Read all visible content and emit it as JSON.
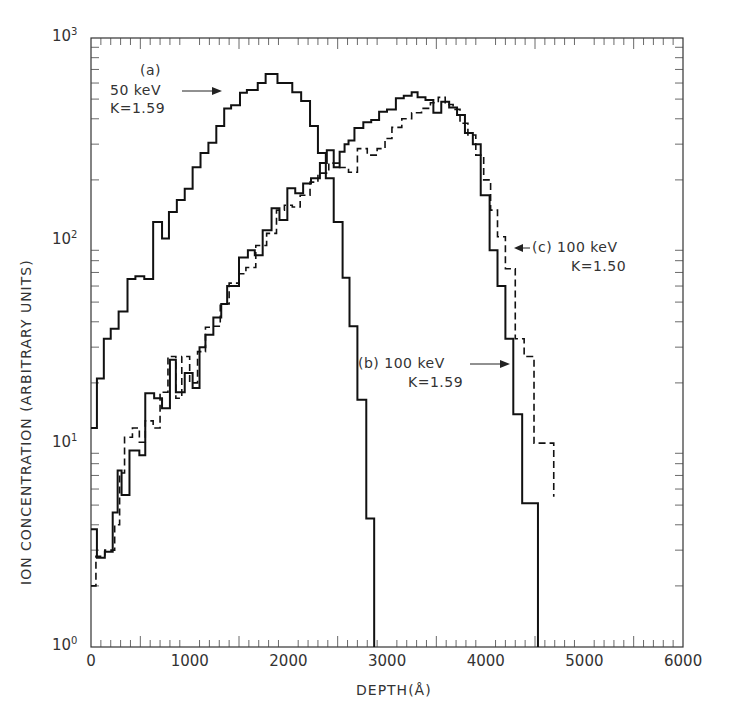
{
  "chart_data": {
    "type": "line",
    "title": "",
    "xlabel": "DEPTH(Å)",
    "ylabel": "ION CONCENTRATION (ARBITRARY UNITS)",
    "xlim": [
      0,
      6000
    ],
    "ylim": [
      1,
      1000
    ],
    "yscale": "log",
    "grid": false,
    "x_ticks": [
      0,
      1000,
      2000,
      3000,
      4000,
      5000,
      6000
    ],
    "x_tick_labels": [
      "0",
      "1000",
      "2000",
      "3000",
      "4000",
      "5000",
      "6000"
    ],
    "y_ticks": [
      1,
      10,
      100,
      1000
    ],
    "y_tick_labels": [
      {
        "base": "10",
        "exp": "0"
      },
      {
        "base": "10",
        "exp": "1"
      },
      {
        "base": "10",
        "exp": "2"
      },
      {
        "base": "10",
        "exp": "3"
      }
    ],
    "step_style": "histogram",
    "series": [
      {
        "name": "(a) 50 keV K=1.59",
        "style": "solid",
        "edges": [
          0,
          60,
          130,
          200,
          280,
          370,
          450,
          540,
          630,
          720,
          790,
          870,
          950,
          1030,
          1110,
          1190,
          1270,
          1350,
          1420,
          1510,
          1580,
          1690,
          1770,
          1890,
          2040,
          2130,
          2220,
          2300,
          2380,
          2460,
          2550,
          2620,
          2700,
          2790,
          2870
        ],
        "values": [
          12,
          21,
          33,
          37,
          45,
          65,
          67,
          65,
          124,
          103,
          139,
          159,
          181,
          231,
          271,
          305,
          369,
          449,
          466,
          538,
          555,
          600,
          665,
          600,
          540,
          490,
          369,
          271,
          204,
          124,
          66,
          38,
          16.5,
          4.3
        ]
      },
      {
        "name": "(b) 100 keV K=1.59",
        "style": "solid",
        "edges": [
          0,
          60,
          140,
          220,
          270,
          310,
          390,
          490,
          550,
          640,
          720,
          800,
          860,
          950,
          1030,
          1100,
          1160,
          1240,
          1320,
          1380,
          1440,
          1500,
          1590,
          1660,
          1740,
          1830,
          1910,
          1990,
          2070,
          2150,
          2230,
          2320,
          2390,
          2460,
          2520,
          2570,
          2610,
          2670,
          2760,
          2840,
          2920,
          3000,
          3090,
          3170,
          3250,
          3310,
          3390,
          3470,
          3550,
          3630,
          3710,
          3790,
          3870,
          3950,
          4040,
          4120,
          4200,
          4280,
          4370,
          4530
        ],
        "values": [
          3.8,
          2.75,
          2.95,
          4.6,
          7.4,
          5.6,
          9.3,
          8.8,
          17.8,
          16.8,
          15,
          26,
          18,
          22.4,
          18.9,
          30,
          34.5,
          42,
          49,
          60,
          60,
          83,
          90,
          85,
          113,
          145,
          127,
          182,
          172,
          192,
          204,
          242,
          280,
          231,
          275,
          300,
          313,
          360,
          385,
          395,
          433,
          445,
          505,
          520,
          540,
          510,
          495,
          428,
          485,
          455,
          418,
          340,
          300,
          168,
          90,
          60,
          33,
          14,
          5.1
        ]
      },
      {
        "name": "(c) 100 keV K=1.50",
        "style": "dashed",
        "edges": [
          0,
          50,
          140,
          240,
          290,
          340,
          420,
          490,
          550,
          630,
          700,
          780,
          860,
          920,
          1000,
          1080,
          1160,
          1230,
          1310,
          1400,
          1500,
          1570,
          1670,
          1780,
          1880,
          1960,
          2040,
          2120,
          2220,
          2300,
          2410,
          2510,
          2610,
          2700,
          2800,
          2900,
          2980,
          3050,
          3150,
          3250,
          3350,
          3440,
          3520,
          3590,
          3670,
          3740,
          3820,
          3900,
          3980,
          4050,
          4120,
          4200,
          4300,
          4390,
          4490,
          4690
        ],
        "values": [
          2,
          2.8,
          3,
          4,
          7.2,
          10.8,
          12,
          10.2,
          13,
          12,
          18,
          27,
          16.8,
          27,
          20,
          28.5,
          37.6,
          38,
          49,
          62,
          69,
          74,
          95,
          109,
          142,
          150,
          147,
          168,
          195,
          216,
          242,
          230,
          218,
          285,
          265,
          285,
          320,
          363,
          400,
          428,
          450,
          480,
          510,
          470,
          445,
          380,
          333,
          265,
          200,
          142,
          105,
          73,
          33,
          27,
          10.1,
          5.5
        ]
      }
    ],
    "annotations": [
      {
        "lines": [
          "(a)",
          "50 keV",
          "K=1.59"
        ],
        "points_to_series": "(a) 50 keV K=1.59"
      },
      {
        "lines": [
          "(b) 100 keV",
          "K=1.59"
        ],
        "points_to_series": "(b) 100 keV K=1.59"
      },
      {
        "lines": [
          "(c) 100 keV",
          "K=1.50"
        ],
        "points_to_series": "(c) 100 keV K=1.50"
      }
    ]
  },
  "labels": {
    "xlabel": "DEPTH(Å)",
    "ylabel": "ION CONCENTRATION (ARBITRARY UNITS)",
    "a_line1": "(a)",
    "a_line2": "50 keV",
    "a_line3": "K=1.59",
    "b_line1": "(b) 100 keV",
    "b_line2": "K=1.59",
    "c_line1": "(c) 100 keV",
    "c_line2": "K=1.50"
  }
}
